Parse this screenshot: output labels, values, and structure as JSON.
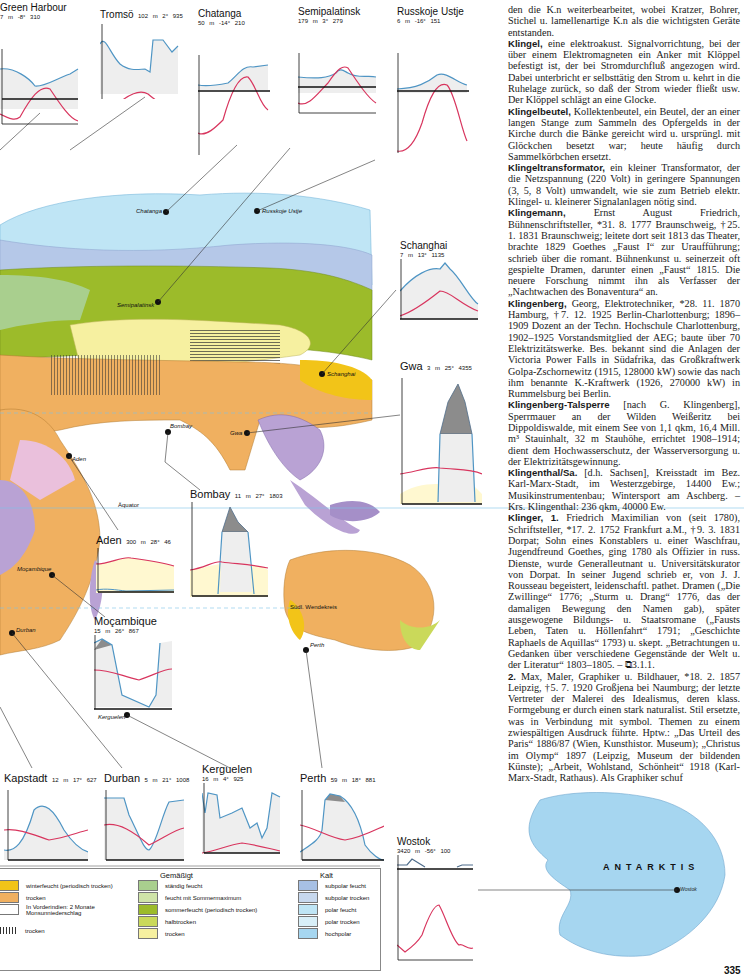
{
  "map": {
    "labels": {
      "chatanga": "Chatanga",
      "russkoje": "Russkoje Ustje",
      "semipalatinsk": "Semipalatinsk",
      "schanghai": "Schanghai",
      "bombay": "Bombay",
      "gwa": "Gwa",
      "aden": "Aden",
      "mocambique": "Moçambique",
      "durban": "Durban",
      "kerguelen": "Kerguelen",
      "perth": "Perth",
      "wostok": "Wostok",
      "aequator": "Äquator",
      "wendekreis": "Südl. Wendekreis",
      "antarktis": "ANTARKTIS"
    }
  },
  "climate_charts": [
    {
      "name": "Green Harbour",
      "elev": "7 m",
      "temp": "-8°",
      "precip": "310"
    },
    {
      "name": "Tromsö",
      "elev": "102 m",
      "temp": "2°",
      "precip": "935"
    },
    {
      "name": "Chatanga",
      "elev": "50 m",
      "temp": "-14°",
      "precip": "210"
    },
    {
      "name": "Semipalatinsk",
      "elev": "179 m",
      "temp": "3°",
      "precip": "279"
    },
    {
      "name": "Russkoje Ustje",
      "elev": "6 m",
      "temp": "-16°",
      "precip": "151"
    },
    {
      "name": "Schanghai",
      "elev": "7 m",
      "temp": "13°",
      "precip": "1135"
    },
    {
      "name": "Gwa",
      "elev": "3 m",
      "temp": "25°",
      "precip": "4355"
    },
    {
      "name": "Bombay",
      "elev": "11 m",
      "temp": "27°",
      "precip": "1803"
    },
    {
      "name": "Aden",
      "elev": "300 m",
      "temp": "28°",
      "precip": "46"
    },
    {
      "name": "Moçambique",
      "elev": "15 m",
      "temp": "26°",
      "precip": "867"
    },
    {
      "name": "Kapstadt",
      "elev": "12 m",
      "temp": "17°",
      "precip": "627"
    },
    {
      "name": "Durban",
      "elev": "5 m",
      "temp": "21°",
      "precip": "1008"
    },
    {
      "name": "Kerguelen",
      "elev": "16 m",
      "temp": "4°",
      "precip": "925"
    },
    {
      "name": "Perth",
      "elev": "59 m",
      "temp": "18°",
      "precip": "881"
    },
    {
      "name": "Wostok",
      "elev": "3420 m",
      "temp": "-56°",
      "precip": "100"
    }
  ],
  "axis_months": [
    "M",
    "J",
    "S",
    "D"
  ],
  "legend": {
    "tropical": [
      {
        "label": "winterfeucht (periodisch trocken)",
        "color": "#f2c418"
      },
      {
        "label": "trocken",
        "color": "#f0b060"
      },
      {
        "label": "In Vorderindien: 2 Monate Monsunniederschlag",
        "color": "#ffffff"
      },
      {
        "label": "trocken",
        "color": "hatch"
      }
    ],
    "temperate_title": "Gemäßigt",
    "temperate": [
      {
        "label": "ständig feucht",
        "color": "#a9cf8e"
      },
      {
        "label": "feucht mit Sommermaximum",
        "color": "#cfe4a8"
      },
      {
        "label": "sommerfeucht (periodisch trocken)",
        "color": "#9cbb2a"
      },
      {
        "label": "halbtrocken",
        "color": "#cad95a"
      },
      {
        "label": "trocken",
        "color": "#f6f0a0"
      }
    ],
    "cold_title": "Kalt",
    "cold": [
      {
        "label": "subpolar feucht",
        "color": "#a7c0e4"
      },
      {
        "label": "subpolar trocken",
        "color": "#c7d8ee"
      },
      {
        "label": "polar feucht",
        "color": "#bfe5f5"
      },
      {
        "label": "polar trocken",
        "color": "#d8eff8"
      },
      {
        "label": "hochpolar",
        "color": "#a6d6f0"
      }
    ]
  },
  "article": {
    "p0": "den die K.n weiterbearbeitet, wobei Kratzer, Bohrer, Stichel u. lamellenartige K.n als die wichtigsten Geräte entstanden.",
    "p1_kw": "Klingel,",
    "p1": " eine elektroakust. Signalvorrichtung, bei der über einem Elektromagneten ein Anker mit Klöppel befestigt ist, der bei Stromdurchfluß angezogen wird. Dabei unterbricht er selbsttätig den Strom u. kehrt in die Ruhelage zurück, so daß der Strom wieder fließt usw. Der Klöppel schlägt an eine Glocke.",
    "p2_kw": "Klingelbeutel,",
    "p2": " Kollektenbeutel, ein Beutel, der an einer langen Stange zum Sammeln des Opfergelds in der Kirche durch die Bänke gereicht wird u. ursprüngl. mit Glöckchen besetzt war; heute häufig durch Sammelkörbchen ersetzt.",
    "p3_kw": "Klingeltransformator,",
    "p3": " ein kleiner Transformator, der die Netzspannung (220 Volt) in geringere Spannungen (3, 5, 8 Volt) umwandelt, wie sie zum Betrieb elektr. Klingel- u. kleinerer Signalanlagen nötig sind.",
    "p4_kw": "Klingemann,",
    "p4": " Ernst August Friedrich, Bühnenschriftsteller, *31. 8. 1777 Braunschweig, †25. 1. 1831 Braunschweig; leitete dort seit 1813 das Theater, brachte 1829 Goethes „Faust I“ zur Uraufführung; schrieb über die romant. Bühnenkunst u. seinerzeit oft gespielte Dramen, darunter einen „Faust“ 1815. Die neuere Forschung nimmt ihn als Verfasser der „Nachtwachen des Bonaventura“ an.",
    "p5_kw": "Klingenberg,",
    "p5": " Georg, Elektrotechniker, *28. 11. 1870 Hamburg, †7. 12. 1925 Berlin-Charlottenburg; 1896–1909 Dozent an der Techn. Hochschule Charlottenburg, 1902–1925 Vorstandsmitglied der AEG; baute über 70 Elektrizitätswerke. Bes. bekannt sind die Anlagen der Victoria Power Falls in Südafrika, das Großkraftwerk Golpa-Zschornewitz (1915, 128000 kW) sowie das nach ihm benannte K.-Kraftwerk (1926, 270000 kW) in Rummelsburg bei Berlin.",
    "p6_kw": "Klingenberg-Talsperre",
    "p6": " [nach G. Klingenberg], Sperrmauer an der Wilden Weißeritz bei Dippoldiswalde, mit einem See von 1,1 qkm, 16,4 Mill. m³ Stauinhalt, 32 m Stauhöhe, errichtet 1908–1914; dient dem Hochwasserschutz, der Wasserversorgung u. der Elektrizitätsgewinnung.",
    "p7_kw": "Klingenthal/Sa.",
    "p7": " [d.h. Sachsen], Kreisstadt im Bez. Karl-Marx-Stadt, im Westerzgebirge, 14400 Ew.; Musikinstrumentenbau; Wintersport am Aschberg. – Krs. Klingenthal: 236 qkm, 40000 Ew.",
    "p8_kw": "Klinger, 1.",
    "p8": " Friedrich Maximilian von (seit 1780), Schriftsteller, *17. 2. 1752 Frankfurt a.M., †9. 3. 1831 Dorpat; Sohn eines Konstablers u. einer Waschfrau, Jugendfreund Goethes, ging 1780 als Offizier in russ. Dienste, wurde Generalleutnant u. Universitätskurator von Dorpat. In seiner Jugend schrieb er, von J. J. Rousseau begeistert, leidenschaftl. pathet. Dramen („Die Zwillinge“ 1776; „Sturm u. Drang“ 1776, das der damaligen Bewegung den Namen gab), später ausgewogene Bildungs- u. Staatsromane („Fausts Leben, Taten u. Höllenfahrt“ 1791; „Geschichte Raphaels de Aquillas“ 1793) u. skept. „Betrachtungen u. Gedanken über verschiedene Gegenstände der Welt u. der Literatur“ 1803–1805. – ⧉3.1.1.",
    "p9_kw": "2.",
    "p9": " Max, Maler, Graphiker u. Bildhauer, *18. 2. 1857 Leipzig, †5. 7. 1920 Großjena bei Naumburg; der letzte Vertreter der Malerei des Idealismus, deren klass. Formgebung er durch einen stark naturalist. Stil ersetzte, was in Verbindung mit symbol. Themen zu einem zwiespältigen Ausdruck führte. Hptw.: „Das Urteil des Paris“ 1886/87 (Wien, Kunsthistor. Museum); „Christus im Olymp“ 1897 (Leipzig, Museum der bildenden Künste); „Arbeit, Wohlstand, Schönheit“ 1918 (Karl-Marx-Stadt, Rathaus). Als Graphiker schuf"
  },
  "page_number": "335"
}
